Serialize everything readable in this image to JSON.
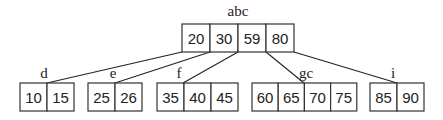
{
  "diagram": {
    "type": "b-tree",
    "root": {
      "label": "abc",
      "keys": [
        "20",
        "30",
        "59",
        "80"
      ],
      "x": 182,
      "y": 24,
      "cell_width": 28,
      "height": 28,
      "label_x": 238,
      "label_y": 16
    },
    "children": [
      {
        "label": "d",
        "keys": [
          "10",
          "15"
        ],
        "x": 20,
        "cell_width": 27,
        "label_x": 44,
        "parent_x": 182,
        "child_x": 47
      },
      {
        "label": "e",
        "keys": [
          "25",
          "26"
        ],
        "x": 88,
        "cell_width": 27,
        "label_x": 113,
        "parent_x": 210,
        "child_x": 115
      },
      {
        "label": "f",
        "keys": [
          "35",
          "40",
          "45"
        ],
        "x": 157,
        "cell_width": 27,
        "label_x": 179,
        "parent_x": 238,
        "child_x": 183
      },
      {
        "label": "gc",
        "keys": [
          "60",
          "65",
          "70",
          "75"
        ],
        "x": 252,
        "cell_width": 26.2,
        "label_x": 306,
        "parent_x": 266,
        "child_x": 304
      },
      {
        "label": "i",
        "keys": [
          "85",
          "90"
        ],
        "x": 370,
        "cell_width": 27,
        "label_x": 393,
        "parent_x": 294,
        "child_x": 397
      }
    ],
    "child_y": 83,
    "child_height": 28,
    "child_label_y": 78,
    "colors": {
      "stroke": "#333333",
      "text": "#222222",
      "background": "#ffffff"
    }
  }
}
